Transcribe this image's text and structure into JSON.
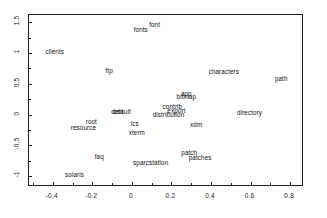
{
  "chart_data": {
    "type": "scatter",
    "title": "",
    "subtitle": "",
    "xlabel": "",
    "ylabel": "",
    "xlim": [
      -0.52,
      0.87
    ],
    "ylim": [
      -1.18,
      1.62
    ],
    "grid": false,
    "legend": null,
    "marker_style": "text-label-only",
    "xticks": [
      -0.4,
      -0.2,
      0,
      0.2,
      0.4,
      0.6,
      0.8
    ],
    "xticklabels": [
      "-0.4",
      "-0.2",
      "0",
      "0.2",
      "0.4",
      "0.6",
      "0.8"
    ],
    "yticks": [
      -1,
      -0.5,
      0,
      0.5,
      1,
      1.5
    ],
    "yticklabels": [
      "-1",
      "-0.5",
      "0",
      "0.5",
      "1",
      "1.5"
    ],
    "points": [
      {
        "label": "font",
        "x": 0.115,
        "y": 1.455
      },
      {
        "label": "fonts",
        "x": 0.045,
        "y": 1.375
      },
      {
        "label": "clients",
        "x": -0.39,
        "y": 1.02
      },
      {
        "label": "ftp",
        "x": -0.115,
        "y": 0.715
      },
      {
        "label": "characters",
        "x": 0.465,
        "y": 0.69
      },
      {
        "label": "path",
        "x": 0.755,
        "y": 0.585
      },
      {
        "label": "app",
        "x": 0.275,
        "y": 0.34
      },
      {
        "label": "bitmap",
        "x": 0.275,
        "y": 0.285
      },
      {
        "label": "contrib",
        "x": 0.205,
        "y": 0.115
      },
      {
        "label": "export",
        "x": 0.225,
        "y": 0.055
      },
      {
        "label": "default",
        "x": -0.055,
        "y": 0.035
      },
      {
        "label": "cad",
        "x": -0.07,
        "y": 0.035
      },
      {
        "label": "directory",
        "x": 0.595,
        "y": 0.025
      },
      {
        "label": "distribution",
        "x": 0.185,
        "y": -0.01
      },
      {
        "label": "root",
        "x": -0.205,
        "y": -0.125
      },
      {
        "label": "lcs",
        "x": 0.015,
        "y": -0.155
      },
      {
        "label": "xdm",
        "x": 0.325,
        "y": -0.165
      },
      {
        "label": "resource",
        "x": -0.245,
        "y": -0.215
      },
      {
        "label": "xterm",
        "x": 0.025,
        "y": -0.305
      },
      {
        "label": "patch",
        "x": 0.29,
        "y": -0.62
      },
      {
        "label": "faq",
        "x": -0.165,
        "y": -0.695
      },
      {
        "label": "patches",
        "x": 0.345,
        "y": -0.715
      },
      {
        "label": "sparcstation",
        "x": 0.095,
        "y": -0.795
      },
      {
        "label": "solaris",
        "x": -0.29,
        "y": -0.985
      }
    ]
  },
  "colors": {
    "axis": "#1a1a1a",
    "text": "#111111",
    "background": "#ffffff"
  }
}
